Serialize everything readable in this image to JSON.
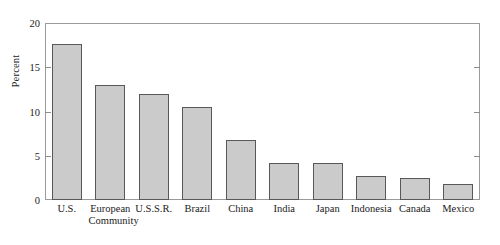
{
  "chart_data": {
    "type": "bar",
    "title": "",
    "xlabel": "",
    "ylabel": "Percent",
    "ylim": [
      0,
      20
    ],
    "yticks": [
      0,
      5,
      10,
      15,
      20
    ],
    "grid": false,
    "legend": null,
    "orientation": "vertical",
    "bar_fill_color": "#cbcbcb",
    "bar_edge_color": "#585858",
    "axis_color": "#9a9a9a",
    "categories": [
      "U.S.",
      "European Community",
      "U.S.S.R.",
      "Brazil",
      "China",
      "India",
      "Japan",
      "Indonesia",
      "Canada",
      "Mexico"
    ],
    "category_label_lines": [
      [
        "U.S."
      ],
      [
        "European",
        "Community"
      ],
      [
        "U.S.S.R."
      ],
      [
        "Brazil"
      ],
      [
        "China"
      ],
      [
        "India"
      ],
      [
        "Japan"
      ],
      [
        "Indonesia"
      ],
      [
        "Canada"
      ],
      [
        "Mexico"
      ]
    ],
    "values": [
      17.6,
      13.0,
      12.0,
      10.5,
      6.8,
      4.2,
      4.2,
      2.7,
      2.5,
      1.8
    ]
  },
  "axis": {
    "tick_labels": [
      "0",
      "5",
      "10",
      "15",
      "20"
    ],
    "y_title": "Percent"
  },
  "caption": {
    "text": ""
  }
}
